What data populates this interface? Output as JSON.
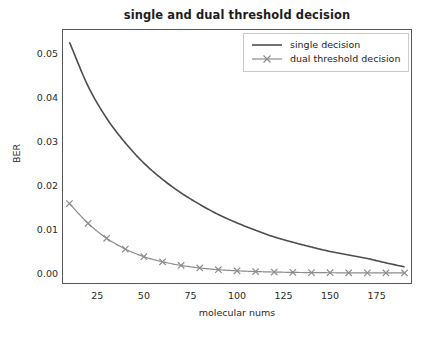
{
  "chart_data": {
    "type": "line",
    "title": "single and dual threshold decision",
    "xlabel": "molecular nums",
    "ylabel": "BER",
    "xlim": [
      6,
      194
    ],
    "ylim": [
      -0.0025,
      0.0555
    ],
    "xticks": [
      25,
      50,
      75,
      100,
      125,
      150,
      175
    ],
    "xtick_labels": [
      "25",
      "50",
      "75",
      "100",
      "125",
      "150",
      "175"
    ],
    "yticks": [
      0.0,
      0.01,
      0.02,
      0.03,
      0.04,
      0.05
    ],
    "ytick_labels": [
      "0.00",
      "0.01",
      "0.02",
      "0.03",
      "0.04",
      "0.05"
    ],
    "grid": false,
    "legend_position": "upper right",
    "x": [
      10,
      20,
      30,
      40,
      50,
      60,
      70,
      80,
      90,
      100,
      110,
      120,
      130,
      140,
      150,
      160,
      170,
      180,
      190
    ],
    "series": [
      {
        "name": "single decision",
        "marker": "none",
        "linestyle": "solid",
        "color": "#4d4d4d",
        "values": [
          0.0525,
          0.0425,
          0.0352,
          0.0296,
          0.025,
          0.0213,
          0.0182,
          0.0156,
          0.0133,
          0.0114,
          0.0097,
          0.0082,
          0.007,
          0.0059,
          0.0049,
          0.0041,
          0.0033,
          0.0023,
          0.0014
        ]
      },
      {
        "name": "dual threshold decision",
        "marker": "x",
        "linestyle": "solid",
        "color": "#8c8c8c",
        "values": [
          0.0158,
          0.0113,
          0.0079,
          0.00545,
          0.0037,
          0.00255,
          0.00172,
          0.00115,
          0.00075,
          0.0005,
          0.00033,
          0.00022,
          0.00014,
          9e-05,
          6e-05,
          4e-05,
          3e-05,
          2e-05,
          1e-05
        ]
      }
    ]
  },
  "legend": {
    "entries": [
      {
        "label": "single decision"
      },
      {
        "label": "dual threshold decision"
      }
    ]
  },
  "colors": {
    "single_decision": "#4d4d4d",
    "dual_threshold_decision": "#8c8c8c",
    "axis": "#555555",
    "text": "#1d1d1d",
    "background": "#ffffff"
  }
}
